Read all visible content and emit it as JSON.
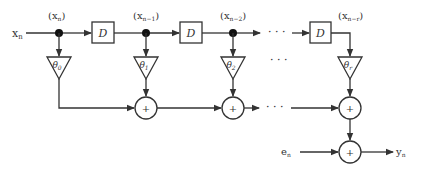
{
  "diagram": {
    "type": "signal-flow / tapped delay line (FIR filter)",
    "input_label": "x",
    "input_sub": "n",
    "tap_labels": [
      {
        "base": "(x",
        "sub": "n",
        "close": ")"
      },
      {
        "base": "(x",
        "sub": "n−1",
        "close": ")"
      },
      {
        "base": "(x",
        "sub": "n−2",
        "close": ")"
      },
      {
        "base": "(x",
        "sub": "n−r",
        "close": ")"
      }
    ],
    "delay_label": "D",
    "gains": [
      {
        "sym": "θ",
        "sub": "0"
      },
      {
        "sym": "θ",
        "sub": "1"
      },
      {
        "sym": "θ",
        "sub": "2"
      },
      {
        "sym": "θ",
        "sub": "r"
      }
    ],
    "adder_symbol": "+",
    "ellipsis": "· · ·",
    "noise_label": "e",
    "noise_sub": "n",
    "output_label": "y",
    "output_sub": "n",
    "colors": {
      "stroke": "#333333",
      "background": "#ffffff"
    }
  }
}
